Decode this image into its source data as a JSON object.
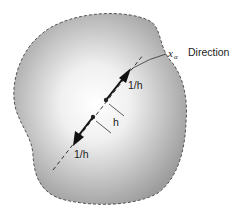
{
  "diagram": {
    "type": "body-with-direction",
    "region": {
      "fill_center": "#ffffff",
      "fill_edge": "#9a9a9a",
      "border": "dashed",
      "border_color": "#555555"
    },
    "direction_label": {
      "symbol": "x",
      "subscript": "α",
      "text": "Direction"
    },
    "arrow_upper_label": "1/h",
    "arrow_lower_label": "1/h",
    "spacing_label": "h",
    "colors": {
      "line": "#222222",
      "text": "#222222"
    }
  }
}
